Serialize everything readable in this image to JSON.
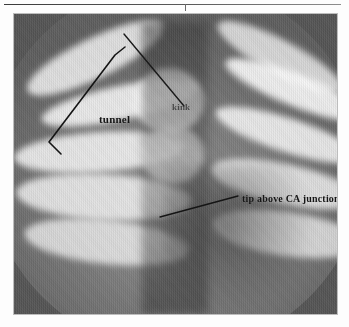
{
  "figure": {
    "kind": "fluoroscopy-radiograph",
    "modality_note": "grayscale fluoroscopic image with circular collimator aperture"
  },
  "page": {
    "rule_present": true,
    "tick_present": true
  },
  "annotations": [
    {
      "id": "tunnel",
      "label": "tunnel",
      "marker": "bracket",
      "description": "angled bracket marking the tunnel tract in the upper-left field"
    },
    {
      "id": "kink",
      "label": "kink",
      "marker": "leader-line",
      "description": "leader line from upper right pointing to a kink in the catheter"
    },
    {
      "id": "tip",
      "label": "tip above CA junction",
      "marker": "leader-line",
      "description": "leader line from lower-left pointing to the catheter tip above the cavoatrial junction"
    }
  ],
  "colors": {
    "ink": "#151515",
    "field_dark": "#555555",
    "field_mid": "#7c7c7c",
    "field_bright": "#d8d8d8",
    "rule": "#3c3c3c"
  }
}
